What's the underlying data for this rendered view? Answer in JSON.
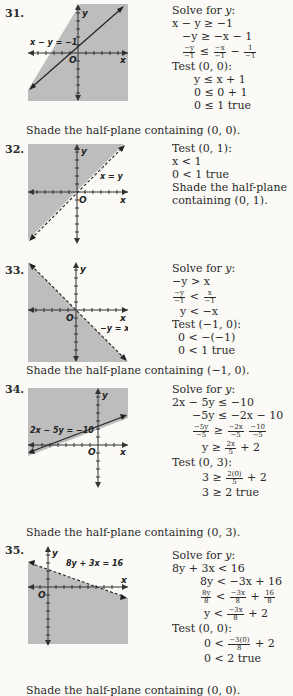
{
  "problems": [
    {
      "number": "31.",
      "line_label": "x − y = −1",
      "axis_x": "x",
      "axis_y": "y",
      "origin": "O",
      "steps": [
        {
          "text": "Solve for y:"
        },
        {
          "text": "x − y ≥ −1",
          "indent": 0
        },
        {
          "text": "−y ≥ −x − 1",
          "indent": 10
        },
        {
          "frac": [
            [
              "−y",
              "−1"
            ],
            "≤",
            [
              "−x",
              "−1"
            ],
            "−",
            [
              "1",
              "−1"
            ]
          ],
          "indent": 10
        },
        {
          "text": "Test (0, 0):"
        },
        {
          "text": "y ≤ x + 1",
          "indent": 22
        },
        {
          "text": "0 ≤ 0 + 1",
          "indent": 22
        },
        {
          "text": "0 ≤ 1 true",
          "indent": 22
        }
      ],
      "conclusion": "Shade the half-plane containing (0, 0)."
    },
    {
      "number": "32.",
      "line_label": "x = y",
      "axis_x": "x",
      "axis_y": "y",
      "origin": "O",
      "steps": [
        {
          "text": "Test (0, 1):"
        },
        {
          "text": "x < 1"
        },
        {
          "text": "0 < 1 true"
        },
        {
          "text": "Shade the half-plane"
        },
        {
          "text": "containing (0, 1)."
        }
      ],
      "conclusion": ""
    },
    {
      "number": "33.",
      "line_label": "−y = x",
      "axis_x": "x",
      "axis_y": "y",
      "origin": "O",
      "steps": [
        {
          "text": "Solve for y:"
        },
        {
          "text": "−y > x"
        },
        {
          "frac": [
            [
              "−y",
              "−1"
            ],
            "<",
            [
              "x",
              "−1"
            ]
          ],
          "indent": 0
        },
        {
          "text": "y < −x",
          "indent": 8
        },
        {
          "text": "Test (−1, 0):"
        },
        {
          "text": "0 < −(−1)",
          "indent": 6
        },
        {
          "text": "0 < 1 true",
          "indent": 6
        }
      ],
      "conclusion": "Shade the half-plane containing (−1, 0)."
    },
    {
      "number": "34.",
      "line_label": "2x − 5y = −10",
      "axis_x": "x",
      "axis_y": "y",
      "origin": "O",
      "steps": [
        {
          "text": "Solve for y:"
        },
        {
          "text": "2x − 5y ≤ −10"
        },
        {
          "text": "−5y ≤ −2x − 10",
          "indent": 20
        },
        {
          "frac": [
            [
              "−5y",
              "−5"
            ],
            "≥",
            [
              "−2x",
              "−5"
            ],
            "",
            [
              "−10",
              "−5"
            ]
          ],
          "indent": 20
        },
        {
          "frac": [
            "y ≥",
            [
              "2x",
              "5"
            ],
            "+ 2"
          ],
          "indent": 30
        },
        {
          "text": "Test (0, 3):"
        },
        {
          "frac": [
            "3 ≥",
            [
              "2(0)",
              "5"
            ],
            "+ 2"
          ],
          "indent": 30
        },
        {
          "text": "3 ≥ 2 true",
          "indent": 30
        }
      ],
      "conclusion": "Shade the half-plane containing (0, 3)."
    },
    {
      "number": "35.",
      "line_label": "8y + 3x = 16",
      "axis_x": "x",
      "axis_y": "y",
      "origin": "O",
      "steps": [
        {
          "text": "Solve for y:"
        },
        {
          "text": "8y + 3x < 16"
        },
        {
          "text": "8y < −3x + 16",
          "indent": 28
        },
        {
          "frac": [
            [
              "8y",
              "8"
            ],
            "<",
            [
              "−3x",
              "8"
            ],
            "+",
            [
              "16",
              "8"
            ]
          ],
          "indent": 28
        },
        {
          "frac": [
            "y <",
            [
              "−3x",
              "8"
            ],
            "+ 2"
          ],
          "indent": 32
        },
        {
          "text": "Test (0, 0):"
        },
        {
          "frac": [
            "0 <",
            [
              "−3(0)",
              "8"
            ],
            "+ 2"
          ],
          "indent": 32
        },
        {
          "text": "0 < 2 true",
          "indent": 32
        }
      ],
      "conclusion": "Shade the half-plane containing (0, 0)."
    }
  ],
  "colors": {
    "shade": "#bdbdbd",
    "ink": "#2a2a2a",
    "background": "#fbfaf7"
  }
}
